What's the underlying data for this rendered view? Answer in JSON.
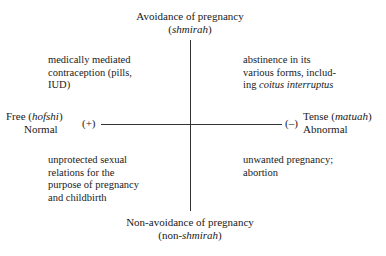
{
  "diagram": {
    "axes": {
      "top": {
        "line1": "Avoidance of pregnancy",
        "line2_pre": "(",
        "line2_italic": "shmirah",
        "line2_post": ")"
      },
      "bottom": {
        "line1": "Non-avoidance of pregnancy",
        "line2_pre": "(non-",
        "line2_italic": "shmirah",
        "line2_post": ")"
      },
      "left": {
        "line1_pre": "Free (",
        "line1_italic": "hofshi",
        "line1_post": ")",
        "line2": "Normal",
        "sign": "(+)"
      },
      "right": {
        "line1_pre": "Tense (",
        "line1_italic": "matuah",
        "line1_post": ")",
        "line2": "Abnormal",
        "sign": "(–)"
      }
    },
    "quadrants": {
      "top_left": [
        "medically mediated",
        "contraception (pills,",
        "IUD)"
      ],
      "top_right": {
        "lines": [
          "abstinence in its",
          "various forms, includ-"
        ],
        "last_pre": "ing ",
        "last_italic": "coitus interruptus"
      },
      "bottom_left": [
        "unprotected sexual",
        "relations for the",
        "purpose of pregnancy",
        "and childbirth"
      ],
      "bottom_right": [
        "unwanted pregnancy;",
        "abortion"
      ]
    }
  }
}
